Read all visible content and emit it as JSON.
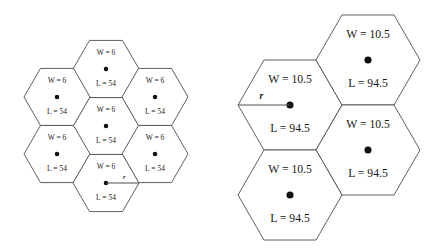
{
  "figure": {
    "background_color": "#ffffff",
    "stroke_color": "#4d4d4d",
    "text_color": "#1a1a1a",
    "dot_color": "#111111",
    "width": 428,
    "height": 252
  },
  "chart_data": {
    "type": "diagram",
    "subtype": "hexagonal-tessellation",
    "clusters": [
      {
        "name": "left-cluster",
        "cell_count": 7,
        "orientation": "flat-top",
        "circumradius_px": 33,
        "center_x": 106,
        "center_y": 126,
        "labels": {
          "w_label": "W = 6",
          "l_label": "L = 54",
          "r_label": "r"
        },
        "w_value": 6,
        "l_value": 54,
        "radius_label_cell_index": 6,
        "radius_direction": "right",
        "cells": [
          {
            "index": 0,
            "cx": 106,
            "cy": 126,
            "w": "W = 6",
            "l": "L = 54"
          },
          {
            "index": 1,
            "cx": 106,
            "cy": 69,
            "w": "W = 6",
            "l": "L = 54"
          },
          {
            "index": 2,
            "cx": 155,
            "cy": 97,
            "w": "W = 6",
            "l": "L = 54"
          },
          {
            "index": 3,
            "cx": 155,
            "cy": 154,
            "w": "W = 6",
            "l": "L = 54"
          },
          {
            "index": 4,
            "cx": 57,
            "cy": 97,
            "w": "W = 6",
            "l": "L = 54"
          },
          {
            "index": 5,
            "cx": 57,
            "cy": 154,
            "w": "W = 6",
            "l": "L = 54"
          },
          {
            "index": 6,
            "cx": 106,
            "cy": 183,
            "w": "W = 6",
            "l": "L = 54"
          }
        ]
      },
      {
        "name": "right-cluster",
        "cell_count": 4,
        "orientation": "flat-top",
        "circumradius_px": 52,
        "labels": {
          "w_label": "W = 10.5",
          "l_label": "L = 94.5",
          "r_label": "r"
        },
        "w_value": 10.5,
        "l_value": 94.5,
        "radius_label_cell_index": 0,
        "radius_direction": "left",
        "cells": [
          {
            "index": 0,
            "cx": 290,
            "cy": 105,
            "w": "W = 10.5",
            "l": "L = 94.5"
          },
          {
            "index": 1,
            "cx": 368,
            "cy": 60,
            "w": "W = 10.5",
            "l": "L = 94.5"
          },
          {
            "index": 2,
            "cx": 368,
            "cy": 150,
            "w": "W = 10.5",
            "l": "L = 94.5"
          },
          {
            "index": 3,
            "cx": 290,
            "cy": 195,
            "w": "W = 10.5",
            "l": "L = 94.5"
          }
        ]
      }
    ],
    "legend": [],
    "annotations": [
      {
        "text": "r",
        "cluster": "left-cluster",
        "meaning": "hexagon circumradius"
      },
      {
        "text": "r",
        "cluster": "right-cluster",
        "meaning": "hexagon circumradius"
      }
    ]
  }
}
